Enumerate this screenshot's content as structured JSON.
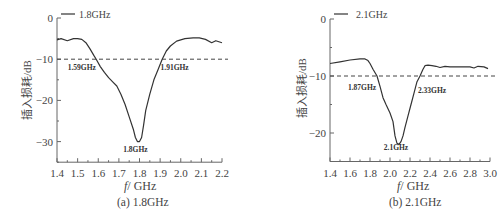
{
  "chart_data": [
    {
      "id": "a",
      "type": "line",
      "caption": "(a) 1.8GHz",
      "title": "",
      "xlabel_var": "f",
      "xlabel_unit": "/ GHz",
      "ylabel": "插入损耗/dB",
      "legend": "1.8GHz",
      "xlim": [
        1.4,
        2.2
      ],
      "ylim": [
        -35,
        0
      ],
      "xticks": [
        1.4,
        1.5,
        1.6,
        1.7,
        1.8,
        1.9,
        2.0,
        2.1,
        2.2
      ],
      "xtick_labels": [
        "1.4",
        "1.5",
        "1.6",
        "1.7",
        "1.8",
        "1.9",
        "2.0",
        "2.1",
        "2.2"
      ],
      "yticks": [
        0,
        -10,
        -20,
        -30
      ],
      "ytick_labels": [
        "0",
        "−10",
        "−20",
        "−30"
      ],
      "reference_line": -10,
      "annotations": [
        {
          "text": "1.59GHz",
          "x": 1.52,
          "y": -12.5
        },
        {
          "text": "1.91GHz",
          "x": 1.97,
          "y": -12.5
        },
        {
          "text": "1.8GHz",
          "x": 1.78,
          "y": -32.5
        }
      ],
      "series": [
        {
          "name": "1.8GHz",
          "x": [
            1.4,
            1.42,
            1.45,
            1.48,
            1.5,
            1.52,
            1.54,
            1.56,
            1.58,
            1.59,
            1.61,
            1.63,
            1.65,
            1.67,
            1.69,
            1.71,
            1.73,
            1.75,
            1.77,
            1.78,
            1.79,
            1.8,
            1.81,
            1.82,
            1.83,
            1.85,
            1.87,
            1.89,
            1.91,
            1.93,
            1.95,
            1.98,
            2.02,
            2.06,
            2.09,
            2.12,
            2.15,
            2.17,
            2.2
          ],
          "y": [
            -5.3,
            -5.0,
            -5.5,
            -5.0,
            -5.0,
            -5.2,
            -6.0,
            -7.5,
            -9.2,
            -10.0,
            -11.8,
            -13.2,
            -14.5,
            -15.5,
            -16.5,
            -18.5,
            -21.0,
            -24.0,
            -27.0,
            -29.0,
            -30.0,
            -30.0,
            -29.0,
            -26.0,
            -22.5,
            -18.5,
            -15.0,
            -12.5,
            -10.0,
            -8.0,
            -6.8,
            -5.6,
            -5.0,
            -4.8,
            -4.8,
            -5.2,
            -6.0,
            -5.5,
            -6.0
          ]
        }
      ]
    },
    {
      "id": "b",
      "type": "line",
      "caption": "(b) 2.1GHz",
      "title": "",
      "xlabel_var": "f",
      "xlabel_unit": "/ GHz",
      "ylabel": "插入损耗/dB",
      "legend": "2.1GHz",
      "xlim": [
        1.4,
        3.0
      ],
      "ylim": [
        -25,
        0
      ],
      "xticks": [
        1.4,
        1.6,
        1.8,
        2.0,
        2.2,
        2.4,
        2.6,
        2.8,
        3.0
      ],
      "xtick_labels": [
        "1.4",
        "1.6",
        "1.8",
        "2.0",
        "2.2",
        "2.4",
        "2.6",
        "2.8",
        "3.0"
      ],
      "yticks": [
        0,
        -10,
        -20
      ],
      "ytick_labels": [
        "0",
        "−10",
        "−20"
      ],
      "reference_line": -10,
      "annotations": [
        {
          "text": "1.87GHz",
          "x": 1.72,
          "y": -12.5
        },
        {
          "text": "2.33GHz",
          "x": 2.42,
          "y": -13.0
        },
        {
          "text": "2.1GHz",
          "x": 2.06,
          "y": -23.0
        }
      ],
      "series": [
        {
          "name": "2.1GHz",
          "x": [
            1.4,
            1.5,
            1.6,
            1.7,
            1.75,
            1.78,
            1.8,
            1.83,
            1.87,
            1.9,
            1.93,
            1.96,
            2.0,
            2.03,
            2.05,
            2.07,
            2.09,
            2.11,
            2.13,
            2.15,
            2.18,
            2.21,
            2.24,
            2.27,
            2.3,
            2.33,
            2.35,
            2.38,
            2.42,
            2.46,
            2.5,
            2.55,
            2.6,
            2.7,
            2.8,
            2.84,
            2.88,
            2.94,
            2.98
          ],
          "y": [
            -7.8,
            -7.5,
            -7.2,
            -7.0,
            -7.0,
            -7.3,
            -7.8,
            -8.8,
            -10.0,
            -11.8,
            -13.8,
            -15.0,
            -16.5,
            -18.0,
            -20.5,
            -21.8,
            -22.0,
            -21.5,
            -20.5,
            -19.0,
            -17.0,
            -15.0,
            -13.0,
            -11.0,
            -10.0,
            -8.8,
            -8.2,
            -8.1,
            -8.2,
            -8.3,
            -8.5,
            -8.3,
            -8.4,
            -8.4,
            -8.4,
            -8.6,
            -8.3,
            -8.4,
            -8.7
          ]
        }
      ]
    }
  ]
}
